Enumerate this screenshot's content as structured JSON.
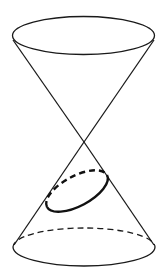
{
  "diagram": {
    "title": "",
    "colors": {
      "background": "#ffffff",
      "line": "#1a1a1a",
      "section": "#111111"
    },
    "shapes": {
      "top_ellipse": {
        "cx": 83.5,
        "cy": 35.5,
        "rx": 71,
        "ry": 19
      },
      "bottom_ellipse": {
        "cx": 84,
        "cy": 247,
        "rx": 71,
        "ry": 19
      },
      "apex": {
        "x": 84,
        "y": 142
      },
      "section_ellipse": {
        "cx": 77,
        "cy": 191,
        "rx": 34,
        "ry": 15,
        "rotation": -28
      }
    }
  }
}
